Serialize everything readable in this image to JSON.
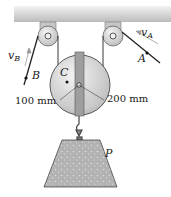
{
  "diagram": {
    "type": "pulley-system",
    "labels": {
      "point_A": "A",
      "point_B": "B",
      "point_C": "C",
      "velocity_A": "v",
      "velocity_A_sub": "A",
      "velocity_B": "v",
      "velocity_B_sub": "B",
      "radius_inner": "100 mm",
      "radius_outer": "200 mm",
      "mass_label": "P"
    },
    "colors": {
      "ceiling": "#d0d0d0",
      "bracket": "#bdbdbd",
      "pulley": "#d4d4d4",
      "mass": "#b8b8b8",
      "line": "#222222"
    }
  }
}
